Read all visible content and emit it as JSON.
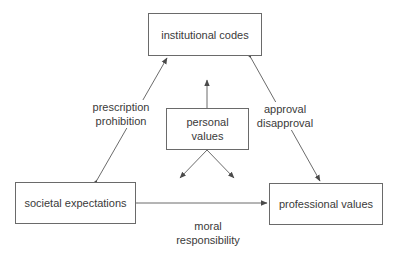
{
  "diagram": {
    "nodes": {
      "institutional_codes": "institutional codes",
      "personal_values_line1": "personal",
      "personal_values_line2": "values",
      "societal_expectations": "societal expectations",
      "professional_values": "professional values"
    },
    "edge_labels": {
      "left_line1": "prescription",
      "left_line2": "prohibition",
      "right_line1": "approval",
      "right_line2": "disapproval",
      "bottom_line1": "moral",
      "bottom_line2": "responsibility"
    },
    "colors": {
      "stroke": "#5a5a5a",
      "text": "#3a3a3a",
      "background": "#ffffff"
    }
  }
}
